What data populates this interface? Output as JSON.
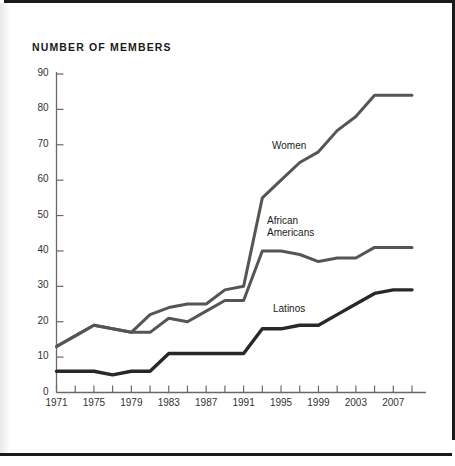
{
  "page": {
    "title": "NUMBER OF MEMBERS"
  },
  "chart_data": {
    "type": "line",
    "title": "NUMBER OF MEMBERS",
    "xlabel": "",
    "ylabel": "NUMBER OF MEMBERS",
    "xlim": [
      1971,
      2009
    ],
    "ylim": [
      0,
      90
    ],
    "ytick_step": 10,
    "xtick_step": 2,
    "xtick_label_step": 4,
    "grid": false,
    "legend": "inline-labels",
    "ytick_labels": [
      "0",
      "10",
      "20",
      "30",
      "40",
      "50",
      "60",
      "70",
      "80",
      "90"
    ],
    "ytick_values": [
      0,
      10,
      20,
      30,
      40,
      50,
      60,
      70,
      80,
      90
    ],
    "xtick_values": [
      1971,
      1973,
      1975,
      1977,
      1979,
      1981,
      1983,
      1985,
      1987,
      1989,
      1991,
      1993,
      1995,
      1997,
      1999,
      2001,
      2003,
      2005,
      2007,
      2009
    ],
    "xtick_labels": [
      "1971",
      "",
      "1975",
      "",
      "1979",
      "",
      "1983",
      "",
      "1987",
      "",
      "1991",
      "",
      "1995",
      "",
      "1999",
      "",
      "2003",
      "",
      "2007",
      ""
    ],
    "x": [
      1971,
      1973,
      1975,
      1977,
      1979,
      1981,
      1983,
      1985,
      1987,
      1989,
      1991,
      1993,
      1995,
      1997,
      1999,
      2001,
      2003,
      2005,
      2007,
      2009
    ],
    "series": [
      {
        "name": "Women",
        "color": "#575553",
        "values": [
          13,
          16,
          19,
          18,
          17,
          22,
          24,
          25,
          25,
          29,
          30,
          55,
          60,
          65,
          68,
          74,
          78,
          84,
          84,
          84
        ]
      },
      {
        "name": "African Americans",
        "color": "#575553",
        "values": [
          13,
          16,
          19,
          18,
          17,
          17,
          21,
          20,
          23,
          26,
          26,
          40,
          40,
          39,
          37,
          38,
          38,
          41,
          41,
          41
        ]
      },
      {
        "name": "Latinos",
        "color": "#2a2826",
        "values": [
          6,
          6,
          6,
          5,
          6,
          6,
          11,
          11,
          11,
          11,
          11,
          18,
          18,
          19,
          19,
          22,
          25,
          28,
          29,
          29
        ]
      }
    ]
  }
}
